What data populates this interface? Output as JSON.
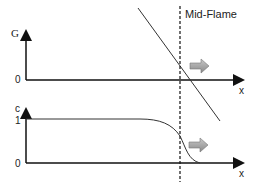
{
  "title_label": "Mid-Flame",
  "top_plot": {
    "y_label": "G",
    "y_zero": "0",
    "x_label": "x"
  },
  "bottom_plot": {
    "y_label": "c",
    "y_one": "1",
    "y_zero": "0",
    "x_label": "x"
  },
  "colors": {
    "line": "#222222",
    "arrow_fill": "#a0a0a0"
  }
}
